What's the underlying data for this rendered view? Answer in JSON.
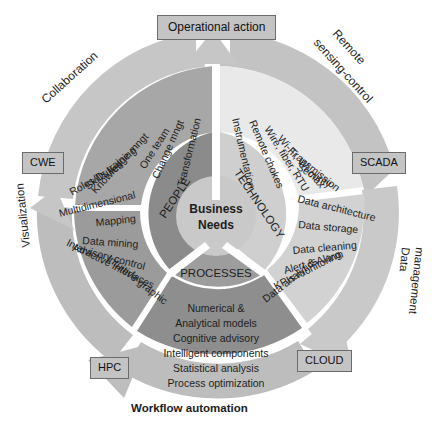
{
  "diagram": {
    "center": {
      "line1": "Business",
      "line2": "Needs"
    },
    "colors": {
      "outer_ring": "#b9b9b9",
      "people_band": "#a8a8a8",
      "technology_band": "#e8e8e8",
      "data_band": "#d0d0d0",
      "processes_band": "#8f8f8f",
      "visualization_band": "#9a9a9a",
      "hub_people": "#8c8c8c",
      "hub_technology": "#cfcfcf",
      "hub_processes": "#9e9e9e",
      "center_disc": "#c8c8c8",
      "box_fill": "#c4c4c4",
      "box_border": "#6b6b6b",
      "text": "#1b1b1b"
    },
    "hub_sectors": [
      {
        "name": "people",
        "label": "PEOPLE"
      },
      {
        "name": "technology",
        "label": "TECHNOLOGY"
      },
      {
        "name": "processes",
        "label": "PROCESSES"
      }
    ],
    "outer_ring_labels": [
      {
        "name": "collaboration",
        "label": "Collaboration"
      },
      {
        "name": "remote-sensing-control",
        "label": "Remote\nsensing-control",
        "line1": "Remote",
        "line2": "sensing-control"
      },
      {
        "name": "data-management",
        "label": "Data\nmanagement",
        "line1": "Data",
        "line2": "management"
      },
      {
        "name": "visualization",
        "label": "Visualization"
      }
    ],
    "endpoint_boxes": [
      {
        "name": "operational-action",
        "label": "Operational action"
      },
      {
        "name": "cwe",
        "label": "CWE"
      },
      {
        "name": "scada",
        "label": "SCADA"
      },
      {
        "name": "hpc",
        "label": "HPC"
      },
      {
        "name": "cloud",
        "label": "CLOUD"
      }
    ],
    "caption": {
      "name": "workflow-automation",
      "label": "Workflow automation"
    },
    "segments": [
      {
        "name": "people",
        "hub_label": "PEOPLE",
        "items": [
          "Transformation",
          "Change mngt",
          "One team",
          "Knowledge mngt",
          "Skills training",
          "Roles/Duties"
        ]
      },
      {
        "name": "technology",
        "hub_label": "TECHNOLOGY",
        "items": [
          "Instrumentation",
          "Remote chokes",
          "Wire, fiber, RTU",
          "Wi-Fi, Wi-max",
          "Transmission",
          "Security"
        ]
      },
      {
        "name": "data-management",
        "hub_label": "",
        "items": [
          "Data architecture",
          "Data storage",
          "Data cleaning",
          "Alert & Alarm",
          "KPIs monitoring",
          "Data analytics"
        ]
      },
      {
        "name": "processes",
        "hub_label": "PROCESSES",
        "items": [
          "Numerical &",
          "Analytical models",
          "Cognitive advisory",
          "Intelligent components",
          "Statistical analysis",
          "Process optimization"
        ]
      },
      {
        "name": "visualization",
        "hub_label": "",
        "items": [
          "Multidimensional",
          "Mapping",
          "Data mining",
          "Advisory control",
          "Interactive interfaces",
          "Intuitive graphic"
        ]
      }
    ]
  }
}
